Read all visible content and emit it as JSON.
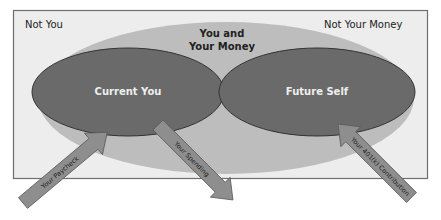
{
  "diagram": {
    "outer_region": {
      "label": "Not You"
    },
    "outer_region_right": {
      "label": "Not Your Money"
    },
    "middle_region": {
      "line1": "You and",
      "line2": "Your Money"
    },
    "left_ellipse": {
      "label": "Current You"
    },
    "right_ellipse": {
      "label": "Future Self"
    },
    "arrows": [
      {
        "label": "Your Paycheck",
        "direction": "in",
        "target": "Current You"
      },
      {
        "label": "Your Spending",
        "direction": "out",
        "source": "Current You"
      },
      {
        "label": "Your 401(k) Contribution",
        "direction": "in",
        "target": "Future Self"
      }
    ]
  },
  "colors": {
    "frame_fill": "#ededed",
    "frame_border": "#6e6e6e",
    "middle_fill": "#bdbdbd",
    "ellipse_fill": "#6a6a6a",
    "ellipse_border": "#333333",
    "arrow_fill": "#8e8e8e",
    "arrow_border": "#5a5a5a",
    "dark_text": "#222222",
    "light_text": "#eeeeee"
  }
}
